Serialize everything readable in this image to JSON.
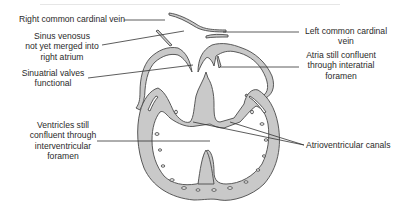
{
  "diagram": {
    "labels": {
      "right_common_cardinal_vein": "Right common cardinal vein",
      "sinus_venosus": [
        "Sinus venosus",
        "not yet merged into",
        "right atrium"
      ],
      "sinuatrial_valves": [
        "Sinuatrial valves",
        "functional"
      ],
      "ventricles_confluent": [
        "Ventricles still",
        "confluent through",
        "interventricular",
        "foramen"
      ],
      "left_common_cardinal_vein": [
        "Left common cardinal",
        "vein"
      ],
      "atria_confluent": [
        "Atria still confluent",
        "through interatrial",
        "foramen"
      ],
      "atrioventricular_canals": "Atrioventricular canals"
    },
    "colors": {
      "tissue_fill": "#c9c9c9",
      "outline": "#4a4a4a",
      "leader_line": "#333333",
      "text": "#2a2a2a"
    }
  }
}
